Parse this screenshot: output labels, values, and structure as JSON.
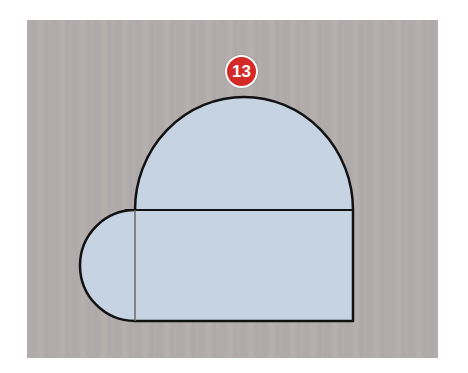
{
  "figure": {
    "step_number": "13",
    "badge_color": "#d42a27",
    "background_color": "#b1abab",
    "shape_fill_color": "#c6d3e3",
    "outline_color": "#111111",
    "guide_line_color": "#6b6b6b",
    "shapes": [
      {
        "type": "half-ellipse",
        "position": "top",
        "description": "dome"
      },
      {
        "type": "rectangle",
        "position": "bottom"
      },
      {
        "type": "half-circle",
        "position": "left",
        "description": "rounded end"
      }
    ]
  }
}
